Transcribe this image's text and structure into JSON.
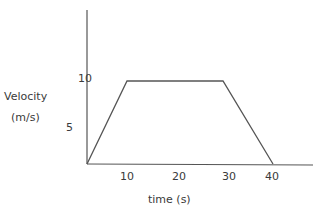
{
  "chart_data": {
    "type": "line",
    "title": "",
    "xlabel": "time (s)",
    "ylabel": "Velocity (m/s)",
    "ylabel_lines": [
      "Velocity",
      "(m/s)"
    ],
    "x_ticks": [
      "10",
      "20",
      "30",
      "40"
    ],
    "y_ticks": [
      "5",
      "10"
    ],
    "xlim": [
      0,
      47
    ],
    "ylim": [
      0,
      18
    ],
    "grid": false,
    "legend": null,
    "series": [
      {
        "name": "velocity",
        "x": [
          0,
          10,
          28,
          40
        ],
        "y": [
          0,
          10,
          10,
          0
        ]
      }
    ],
    "colors": {
      "line": "#555555",
      "axis": "#555555",
      "text": "#3a3a3a"
    }
  }
}
